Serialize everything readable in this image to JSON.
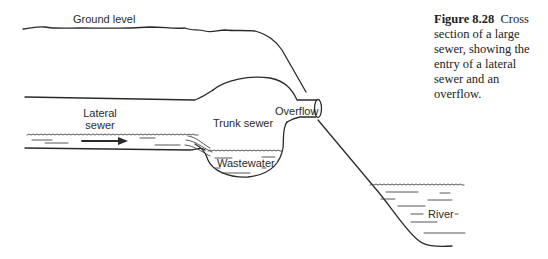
{
  "figure": {
    "number": "Figure 8.28",
    "caption": "Cross section of a large sewer, showing the entry of a lateral sewer and an overflow."
  },
  "labels": {
    "ground_level": "Ground level",
    "lateral_sewer_line1": "Lateral",
    "lateral_sewer_line2": "sewer",
    "trunk_sewer": "Trunk sewer",
    "overflow": "Overflow",
    "wastewater": "Wastewater",
    "river": "River"
  },
  "flow_direction": "left-to-right"
}
